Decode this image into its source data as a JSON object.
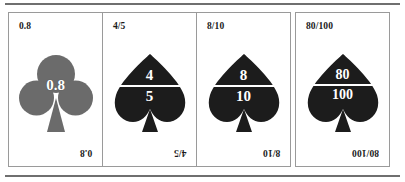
{
  "page": {
    "background_color": "#ffffff",
    "rule_color": "#6f6f6f",
    "card_border_color": "#9a9a9a"
  },
  "cards": [
    {
      "corner_label": "0.8",
      "corner_label_rotated": "0.8",
      "suit": "club",
      "suit_color": "#6b6b6b",
      "value_type": "decimal",
      "value": "0.8",
      "numerator": "",
      "denominator": ""
    },
    {
      "corner_label": "4/5",
      "corner_label_rotated": "4/5",
      "suit": "spade",
      "suit_color": "#1c1c1c",
      "value_type": "fraction",
      "value": "4/5",
      "numerator": "4",
      "denominator": "5"
    },
    {
      "corner_label": "8/10",
      "corner_label_rotated": "8/10",
      "suit": "spade",
      "suit_color": "#1c1c1c",
      "value_type": "fraction",
      "value": "8/10",
      "numerator": "8",
      "denominator": "10"
    },
    {
      "corner_label": "80/100",
      "corner_label_rotated": "80/100",
      "suit": "spade",
      "suit_color": "#1c1c1c",
      "value_type": "fraction",
      "value": "80/100",
      "numerator": "80",
      "denominator": "100"
    }
  ]
}
